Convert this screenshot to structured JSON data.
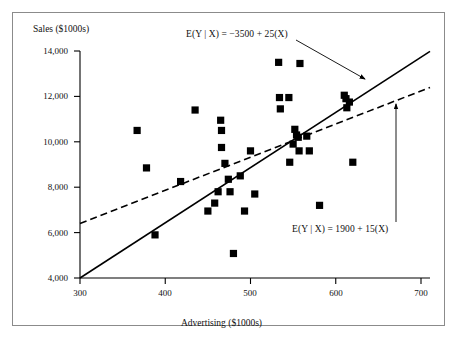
{
  "figure": {
    "background": "#ffffff",
    "frame_color": "#8b8b8b",
    "ink_color": "#000000"
  },
  "labels": {
    "ylabel": "Sales ($1000s)",
    "xlabel": "Advertising ($1000s)",
    "annotation_solid": "E(Y | X) = −3500 + 25(X)",
    "annotation_dashed": "E(Y | X) = 1900 + 15(X)"
  },
  "axis": {
    "xticks": [
      "300",
      "400",
      "500",
      "600",
      "700"
    ],
    "yticks": [
      "4,000",
      "6,000",
      "8,000",
      "10,000",
      "12,000",
      "14,000"
    ]
  },
  "chart_data": {
    "type": "scatter",
    "title": "",
    "xlabel": "Advertising ($1000s)",
    "ylabel": "Sales ($1000s)",
    "xlim": [
      300,
      700
    ],
    "ylim": [
      4000,
      14000
    ],
    "xticks": [
      300,
      400,
      500,
      600,
      700
    ],
    "yticks": [
      4000,
      6000,
      8000,
      10000,
      12000,
      14000
    ],
    "grid": false,
    "legend": "none",
    "marker": "filled-square",
    "marker_color": "#000000",
    "points": [
      {
        "x": 367,
        "y": 10500
      },
      {
        "x": 378,
        "y": 8850
      },
      {
        "x": 388,
        "y": 5900
      },
      {
        "x": 418,
        "y": 8250
      },
      {
        "x": 435,
        "y": 11400
      },
      {
        "x": 450,
        "y": 6950
      },
      {
        "x": 458,
        "y": 7300
      },
      {
        "x": 462,
        "y": 7800
      },
      {
        "x": 465,
        "y": 10950
      },
      {
        "x": 466,
        "y": 10500
      },
      {
        "x": 466,
        "y": 9750
      },
      {
        "x": 470,
        "y": 9050
      },
      {
        "x": 474,
        "y": 8350
      },
      {
        "x": 476,
        "y": 7800
      },
      {
        "x": 480,
        "y": 5080
      },
      {
        "x": 488,
        "y": 8500
      },
      {
        "x": 493,
        "y": 6950
      },
      {
        "x": 500,
        "y": 9600
      },
      {
        "x": 505,
        "y": 7700
      },
      {
        "x": 533,
        "y": 13500
      },
      {
        "x": 534,
        "y": 11950
      },
      {
        "x": 535,
        "y": 11450
      },
      {
        "x": 545,
        "y": 11950
      },
      {
        "x": 546,
        "y": 9100
      },
      {
        "x": 550,
        "y": 9900
      },
      {
        "x": 552,
        "y": 10550
      },
      {
        "x": 554,
        "y": 10300
      },
      {
        "x": 556,
        "y": 10200
      },
      {
        "x": 557,
        "y": 9600
      },
      {
        "x": 558,
        "y": 13450
      },
      {
        "x": 566,
        "y": 10250
      },
      {
        "x": 569,
        "y": 9600
      },
      {
        "x": 581,
        "y": 7200
      },
      {
        "x": 610,
        "y": 12050
      },
      {
        "x": 612,
        "y": 11900
      },
      {
        "x": 613,
        "y": 11500
      },
      {
        "x": 616,
        "y": 11750
      },
      {
        "x": 620,
        "y": 9100
      }
    ],
    "series": [
      {
        "name": "E(Y | X) = −3500 + 25(X)",
        "type": "line",
        "style": "solid",
        "intercept": -3500,
        "slope": 25,
        "x_start": 300,
        "x_end": 700,
        "y_start": 4000,
        "y_end": 14000
      },
      {
        "name": "E(Y | X) = 1900 + 15(X)",
        "type": "line",
        "style": "dashed",
        "intercept": 1900,
        "slope": 15,
        "x_start": 300,
        "x_end": 700,
        "y_start": 6400,
        "y_end": 12400
      }
    ],
    "annotations": [
      {
        "text": "E(Y | X) = −3500 + 25(X)",
        "target_line": "solid",
        "arrow": true
      },
      {
        "text": "E(Y | X) = 1900 + 15(X)",
        "target_line": "dashed",
        "arrow": true
      }
    ]
  }
}
